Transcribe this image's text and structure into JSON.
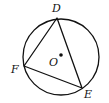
{
  "diagram": {
    "type": "geometry",
    "circle": {
      "center_label": "O",
      "cx": 61,
      "cy": 57,
      "r": 38
    },
    "points": [
      {
        "label": "D",
        "x": 57,
        "y": 18,
        "lx": 52,
        "ly": 12
      },
      {
        "label": "E",
        "x": 82,
        "y": 88,
        "lx": 84,
        "ly": 98
      },
      {
        "label": "F",
        "x": 24,
        "y": 66,
        "lx": 11,
        "ly": 73
      }
    ],
    "center": {
      "label": "O",
      "x": 61,
      "y": 55,
      "lx": 49,
      "ly": 66
    },
    "segments": [
      [
        "D",
        "E"
      ],
      [
        "E",
        "F"
      ],
      [
        "F",
        "D"
      ]
    ],
    "stroke_color": "#111111"
  }
}
